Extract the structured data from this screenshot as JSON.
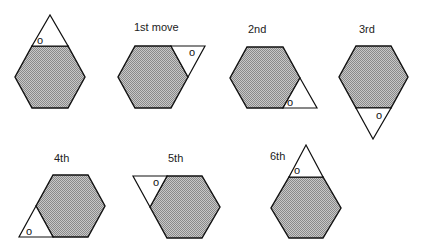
{
  "diagram": {
    "colors": {
      "hexagon_fill": "#b0b0b0",
      "stroke": "#111111",
      "triangle_fill": "#ffffff"
    },
    "panels": [
      {
        "label": "",
        "vertex_mark": "o",
        "triangle_position": "top"
      },
      {
        "label": "1st move",
        "vertex_mark": "o",
        "triangle_position": "upper-right"
      },
      {
        "label": "2nd",
        "vertex_mark": "o",
        "triangle_position": "lower-right"
      },
      {
        "label": "3rd",
        "vertex_mark": "o",
        "triangle_position": "bottom"
      },
      {
        "label": "4th",
        "vertex_mark": "o",
        "triangle_position": "lower-left"
      },
      {
        "label": "5th",
        "vertex_mark": "o",
        "triangle_position": "upper-left"
      },
      {
        "label": "6th",
        "vertex_mark": "o",
        "triangle_position": "top"
      }
    ]
  }
}
